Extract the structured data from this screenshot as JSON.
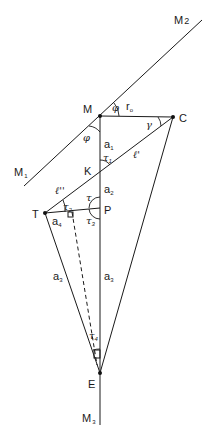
{
  "diagram": {
    "points": {
      "M": "M",
      "C": "C",
      "K": "K",
      "P": "P",
      "T": "T",
      "E": "E"
    },
    "lines": {
      "M1": "M",
      "M1_sub": "1",
      "M2": "M",
      "M2_sub": "2",
      "M3": "M",
      "M3_sub": "3"
    },
    "segments": {
      "r0": "r",
      "r0_sub": "o",
      "a1": "a",
      "a1_sub": "1",
      "a2": "a",
      "a2_sub": "2",
      "a3_left": "a",
      "a3_left_sub": "3",
      "a3_right": "a",
      "a3_right_sub": "3",
      "a4": "a",
      "a4_sub": "4",
      "l_prime": "ℓ'",
      "l_double_prime": "ℓ''"
    },
    "angles": {
      "phi_top": "φ",
      "phi_left": "φ",
      "gamma": "γ",
      "tau": "τ",
      "tau1": "τ",
      "tau1_sub": "1",
      "tau2": "τ",
      "tau2_sub": "2",
      "tau3": "τ",
      "tau3_sub": "3",
      "tau4": "τ",
      "tau4_sub": "4"
    },
    "colors": {
      "line": "#1a1a1a",
      "background": "#ffffff"
    }
  }
}
